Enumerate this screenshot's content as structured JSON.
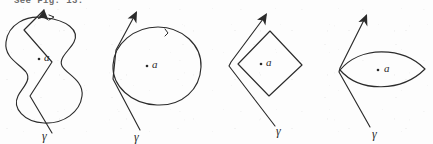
{
  "page": {
    "width": 433,
    "height": 144,
    "background_color": "#fdfdfd",
    "ink_color": "#2b2b2b",
    "caption": "See Fig. 13."
  },
  "figures": [
    {
      "id": "figure-1",
      "shape_name": "wavy-s-closed-curve",
      "point_label": "a",
      "point_marker": ".",
      "curve_label": "γ",
      "arrow_name": "orientation-arrow",
      "arrow_direction": "up-right"
    },
    {
      "id": "figure-2",
      "shape_name": "round-blob-closed-curve",
      "point_label": "a",
      "point_marker": ".",
      "curve_label": "γ",
      "arrow_name": "orientation-arrow",
      "arrow_direction": "up-right"
    },
    {
      "id": "figure-3",
      "shape_name": "diamond-closed-curve",
      "point_label": "a",
      "point_marker": ".",
      "curve_label": "γ",
      "arrow_name": "orientation-arrow",
      "arrow_direction": "up-right"
    },
    {
      "id": "figure-4",
      "shape_name": "lens-closed-curve",
      "point_label": "a",
      "point_marker": ".",
      "curve_label": "γ",
      "arrow_name": "orientation-arrow",
      "arrow_direction": "up-right"
    }
  ]
}
